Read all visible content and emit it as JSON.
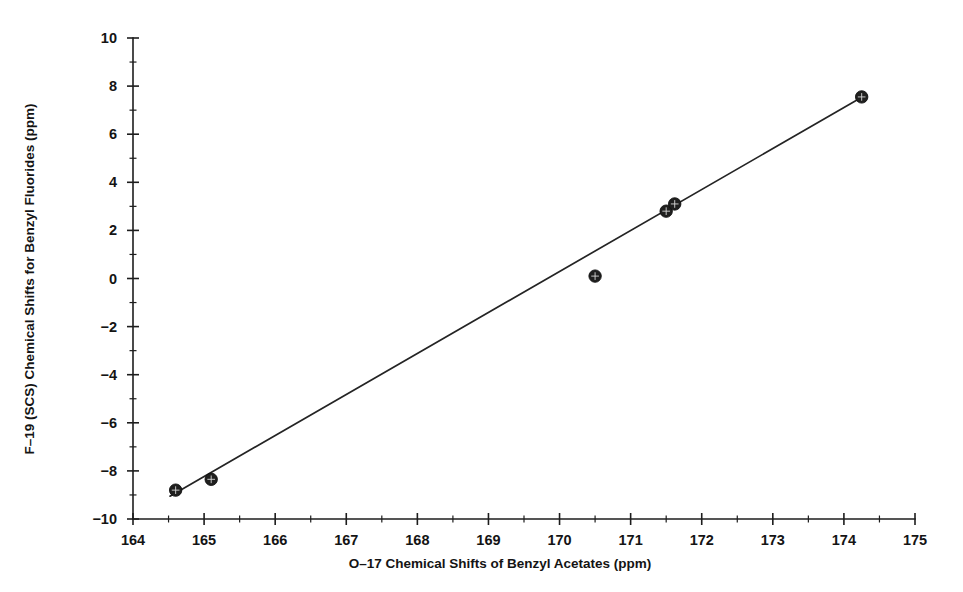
{
  "chart_data": {
    "type": "scatter",
    "title": "",
    "xlabel": "O-17 Chemical Shifts of Benzyl Acetates (ppm)",
    "ylabel": "F-19 (SCS) Chemical Shifts for Benzyl Fluorides (ppm)",
    "xlim": [
      164,
      175
    ],
    "ylim": [
      -10,
      10
    ],
    "grid": false,
    "legend": null,
    "xticks": [
      164,
      165,
      166,
      167,
      168,
      169,
      170,
      171,
      172,
      173,
      174,
      175
    ],
    "xtick_labels": [
      "164",
      "165",
      "166",
      "167",
      "168",
      "169",
      "170",
      "171",
      "172",
      "173",
      "174",
      "175"
    ],
    "xminor_step": 0.5,
    "yticks": [
      -10,
      -8,
      -6,
      -4,
      -2,
      0,
      2,
      4,
      6,
      8,
      10
    ],
    "ytick_labels": [
      "-10",
      "-8",
      "-6",
      "-4",
      "-2",
      "0",
      "2",
      "4",
      "6",
      "8",
      "10"
    ],
    "yminor_step": 1,
    "marker": "filled-circle-crosshatch",
    "points": [
      {
        "x": 164.6,
        "y": -8.8
      },
      {
        "x": 165.1,
        "y": -8.35
      },
      {
        "x": 170.5,
        "y": 0.1
      },
      {
        "x": 171.5,
        "y": 2.8
      },
      {
        "x": 171.62,
        "y": 3.1
      },
      {
        "x": 174.25,
        "y": 7.55
      }
    ],
    "series": [
      {
        "name": "Benzyl fluorides vs benzyl acetates",
        "x": [
          164.6,
          165.1,
          170.5,
          171.5,
          171.62,
          174.25
        ],
        "values": [
          -8.8,
          -8.35,
          0.1,
          2.8,
          3.1,
          7.55
        ]
      }
    ],
    "fit_line": {
      "type": "line",
      "x_start": 164.52,
      "y_start": -9.05,
      "x_end": 174.3,
      "y_end": 7.62
    }
  }
}
